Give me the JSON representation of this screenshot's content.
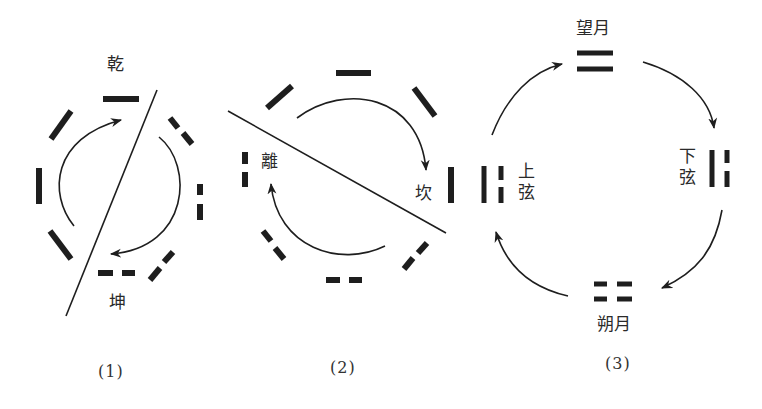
{
  "colors": {
    "ink": "#1e1e1e",
    "text": "#2a2a2a",
    "background": "#ffffff"
  },
  "panels": [
    {
      "id": 1,
      "caption": "(1)",
      "labels": {
        "top": "乾",
        "bottom": "坤"
      },
      "description": "Eight trigram line segments arranged in a circle, diagonal divider, two curved arrows"
    },
    {
      "id": 2,
      "caption": "(2)",
      "labels": {
        "left": "離",
        "right": "坎"
      },
      "description": "Eight trigram line segments arranged in a circle, diagonal divider, two curved arrows"
    },
    {
      "id": 3,
      "caption": "(3)",
      "labels": {
        "top": "望月",
        "right": "下弦",
        "bottom": "朔月",
        "left": "上弦"
      },
      "description": "Four lunar phases with two-line symbols connected by clockwise arrows"
    }
  ]
}
